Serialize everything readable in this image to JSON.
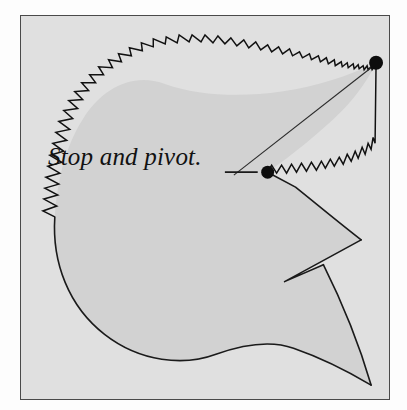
{
  "figure": {
    "frame": {
      "background_color": "#e0e0e0",
      "border_color": "#4a4a4a",
      "x": 20,
      "y": 15,
      "width": 370,
      "height": 385
    },
    "shape": {
      "name": "bird-head-silhouette",
      "fill_color": "#d2d2d2",
      "outline_color": "#1a1a1a",
      "description": "Rounded silhouette with a sawtooth upper-left contour, a deep V notch on the right and a pointed tail at the lower right."
    },
    "annotation": {
      "text": "Stop and pivot.",
      "style": "italic-serif",
      "color": "#111111",
      "font_size_px": 25
    },
    "markers": [
      {
        "name": "apex-dot",
        "label": "top-right apex point",
        "x": 357,
        "y": 47,
        "radius": 7,
        "color": "#0d0d0d"
      },
      {
        "name": "pivot-dot",
        "label": "pivot point",
        "x": 248,
        "y": 157,
        "radius": 6.5,
        "color": "#0d0d0d"
      }
    ],
    "leader": {
      "name": "annotation-leader",
      "dash_from_x": 205,
      "dash_to_x": 238,
      "dash_y": 157,
      "line_from_x": 214,
      "line_from_y": 160,
      "line_to_x": 352,
      "line_to_y": 52
    },
    "zigzag_edges": [
      {
        "name": "upper-sawtooth-edge",
        "teeth": 46,
        "description": "Outward-pointing triangular teeth along the upper-left arc from lower left up over the crown and right to the apex."
      },
      {
        "name": "lower-sawtooth-edge",
        "teeth": 30,
        "description": "Smaller outward-pointing teeth from the pivot dot up and right to the apex."
      }
    ]
  }
}
